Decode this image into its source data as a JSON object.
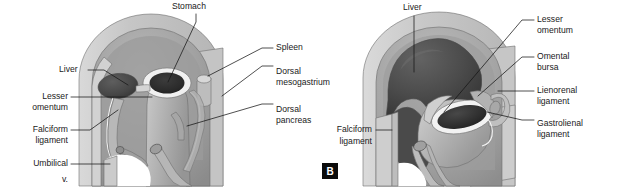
{
  "figure": {
    "background_color": "#ffffff",
    "text_color": "#1a1a1a",
    "leader_line_color": "#161616",
    "palette": {
      "body_wall_light": "#c9c9c9",
      "body_wall_pale": "#dcdcdc",
      "organ_mid": "#a9a9a9",
      "organ_shadow": "#8a8a8a",
      "organ_light": "#c2c2c2",
      "liver_dark": "#4f4f4f",
      "liver_darker": "#3a3a3a",
      "lumen_dark": "#2e2e2e",
      "highlight_white": "#f4f4f4"
    }
  },
  "panels": [
    {
      "id": "panel-a",
      "badge": "",
      "badge_visible": false,
      "labels": [
        {
          "name": "stomach",
          "text": "Stomach",
          "lines": [
            "Stomach"
          ],
          "x": 172,
          "y": 7,
          "anchor": "start"
        },
        {
          "name": "spleen",
          "text": "Spleen",
          "lines": [
            "Spleen"
          ],
          "x": 276,
          "y": 48,
          "anchor": "start"
        },
        {
          "name": "dorsal-mesogastrium",
          "text": "Dorsal mesogastrium",
          "lines": [
            "Dorsal",
            "mesogastrium"
          ],
          "x": 276,
          "y": 72,
          "anchor": "start"
        },
        {
          "name": "dorsal-pancreas",
          "text": "Dorsal pancreas",
          "lines": [
            "Dorsal",
            "pancreas"
          ],
          "x": 276,
          "y": 110,
          "anchor": "start"
        },
        {
          "name": "liver",
          "text": "Liver",
          "lines": [
            "Liver"
          ],
          "x": 59,
          "y": 70,
          "anchor": "start"
        },
        {
          "name": "lesser-omentum",
          "text": "Lesser omentum",
          "lines": [
            "Lesser",
            "omentum"
          ],
          "x": 68,
          "y": 103,
          "anchor": "end"
        },
        {
          "name": "falciform-ligament",
          "text": "Falciform ligament",
          "lines": [
            "Falciform",
            "ligament"
          ],
          "x": 68,
          "y": 136,
          "anchor": "end"
        },
        {
          "name": "umbilical-vein",
          "text": "Umbilical v.",
          "lines": [
            "Umbilical",
            "v."
          ],
          "x": 68,
          "y": 170,
          "anchor": "end"
        }
      ]
    },
    {
      "id": "panel-b",
      "badge": "B",
      "badge_visible": true,
      "labels": [
        {
          "name": "liver",
          "text": "Liver",
          "lines": [
            "Liver"
          ],
          "x": 403,
          "y": 8,
          "anchor": "start"
        },
        {
          "name": "lesser-omentum",
          "text": "Lesser omentum",
          "lines": [
            "Lesser",
            "omentum"
          ],
          "x": 537,
          "y": 20,
          "anchor": "start"
        },
        {
          "name": "omental-bursa",
          "text": "Omental bursa",
          "lines": [
            "Omental",
            "bursa"
          ],
          "x": 537,
          "y": 57,
          "anchor": "start"
        },
        {
          "name": "lienorenal-ligament",
          "text": "Lienorenal ligament",
          "lines": [
            "Lienorenal",
            "ligament"
          ],
          "x": 537,
          "y": 91,
          "anchor": "start"
        },
        {
          "name": "gastrolienal-ligament",
          "text": "Gastrolienal ligament",
          "lines": [
            "Gastrolienal",
            "ligament"
          ],
          "x": 537,
          "y": 127,
          "anchor": "start"
        },
        {
          "name": "falciform-ligament",
          "text": "Falciform ligament",
          "lines": [
            "Falciform",
            "ligament"
          ],
          "x": 372,
          "y": 136,
          "anchor": "end"
        }
      ]
    }
  ]
}
